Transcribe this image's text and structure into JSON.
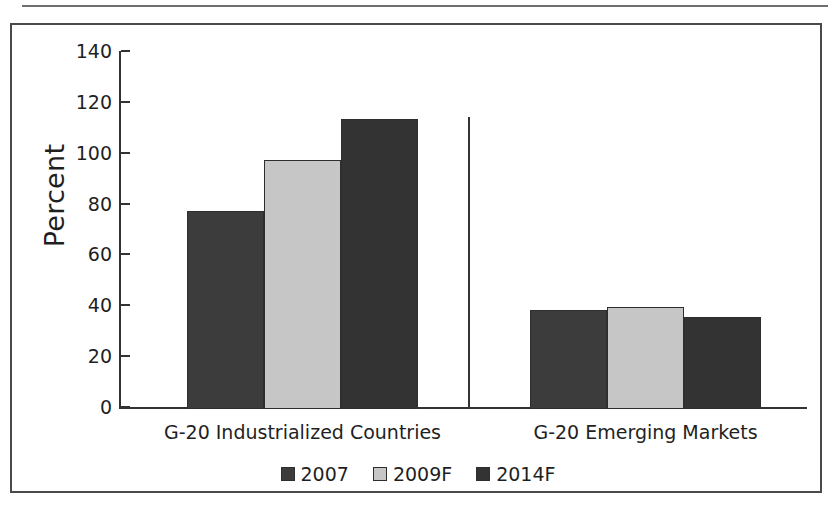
{
  "figure": {
    "y_axis_title": "Percent",
    "separator": "group-divider"
  },
  "chart_data": {
    "type": "bar",
    "title": "",
    "subtitle": "",
    "xlabel": "",
    "ylabel": "Percent",
    "ylim": [
      0,
      140
    ],
    "yticks": [
      0,
      20,
      40,
      60,
      80,
      100,
      120,
      140
    ],
    "ytick_labels": [
      "0",
      "20",
      "40",
      "60",
      "80",
      "100",
      "120",
      "140"
    ],
    "grid": false,
    "legend_position": "bottom",
    "categories": [
      "G-20 Industrialized Countries",
      "G-20 Emerging Markets"
    ],
    "series": [
      {
        "name": "2007",
        "values": [
          78,
          39
        ],
        "color": "#3c3c3c"
      },
      {
        "name": "2009F",
        "values": [
          98,
          40
        ],
        "color": "#c6c6c6"
      },
      {
        "name": "2014F",
        "values": [
          114,
          36
        ],
        "color": "#333333"
      }
    ]
  },
  "legend": {
    "items": [
      {
        "label": "2007",
        "color": "#3c3c3c"
      },
      {
        "label": "2009F",
        "color": "#c6c6c6"
      },
      {
        "label": "2014F",
        "color": "#333333"
      }
    ]
  }
}
